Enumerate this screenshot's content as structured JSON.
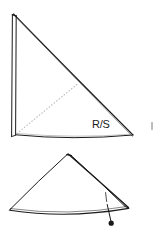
{
  "figure": {
    "background_color": "#ffffff",
    "ink_color": "#1a1a1a",
    "fold_line_color": "#b8b8b8",
    "width": 167,
    "height": 229,
    "labels": [
      {
        "id": "right-side-label",
        "text": "R/S",
        "x": 92,
        "y": 128
      }
    ],
    "shapes": [
      {
        "id": "upper-triangle",
        "name": "upper-right-triangle",
        "description": "Tall right triangle with doubled vertical left edge and bowed base",
        "apex": [
          13,
          14
        ],
        "bottom_left": [
          14,
          136
        ],
        "bottom_right": [
          133,
          135
        ]
      },
      {
        "id": "lower-triangle",
        "name": "lower-flat-triangle",
        "description": "Flat folded triangle with doubled right edge",
        "apex": [
          68,
          154
        ],
        "bottom_left": [
          10,
          210
        ],
        "bottom_right": [
          128,
          207
        ]
      }
    ],
    "annotations": [
      {
        "id": "fold-line",
        "name": "dotted-fold-line",
        "style": "dotted",
        "from": [
          17,
          133
        ],
        "to": [
          77,
          84
        ]
      },
      {
        "id": "leader",
        "name": "leader-line-with-dot",
        "from": [
          106,
          193
        ],
        "to": [
          111,
          222
        ],
        "dot": [
          111,
          223
        ]
      },
      {
        "id": "tick-mark",
        "name": "isolated-tick-mark",
        "x": 152,
        "y": 126
      }
    ]
  }
}
